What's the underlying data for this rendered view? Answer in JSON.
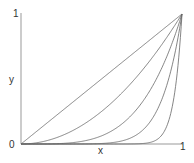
{
  "chart_data": {
    "type": "line",
    "title": "",
    "xlabel": "x",
    "ylabel": "y",
    "xlim": [
      0,
      1
    ],
    "ylim": [
      0,
      1
    ],
    "x_ticks": [
      "0",
      "1"
    ],
    "y_ticks": [
      "0",
      "1"
    ],
    "grid": false,
    "legend": null,
    "series": [
      {
        "name": "y = x^1",
        "exponent": 1
      },
      {
        "name": "y = x^2",
        "exponent": 2
      },
      {
        "name": "y = x^4",
        "exponent": 4
      },
      {
        "name": "y = x^8",
        "exponent": 8
      },
      {
        "name": "y = x^20",
        "exponent": 20
      }
    ],
    "line_color": "#666666",
    "axis_color": "#888888"
  },
  "labels": {
    "y_top": "1",
    "origin": "0",
    "x_right": "1",
    "y_axis": "y",
    "x_axis": "x"
  }
}
